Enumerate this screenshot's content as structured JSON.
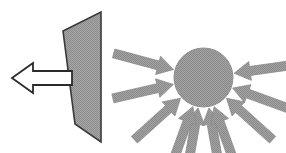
{
  "figure": {
    "title": "Flat plate with single directional arrow versus sphere with converging arrows",
    "background_color": "#ffffff",
    "width": 286,
    "height": 153,
    "palette": {
      "fill_gray": "#9e9e9e",
      "fill_gray_light": "#a8a8a8",
      "outline_dark": "#3a3a3a",
      "outline_black": "#2b2b2b",
      "white": "#ffffff",
      "dither_dark": "#8a8a8a"
    }
  },
  "left_panel": {
    "name": "flat-plate-with-thrust-arrow",
    "label": "Flat plate",
    "plate": {
      "shape": "trapezoid",
      "fill": "#9e9e9e",
      "stroke": "#3a3a3a",
      "stroke_width": 1.6,
      "points": "63,31 101,12 101,142 75,124"
    },
    "arrow": {
      "name": "thrust-arrow-left",
      "direction": "left",
      "fill": "#ffffff",
      "stroke": "#2b2b2b",
      "stroke_width": 1.8,
      "points": "12,78 33,63 33,71 72,71 72,85 33,85 33,93"
    }
  },
  "right_panel": {
    "name": "sphere-with-converging-arrows",
    "label": "Sphere under uniform pressure",
    "circle": {
      "name": "sphere-body",
      "cx": 203.5,
      "cy": 77.5,
      "r": 29.5,
      "fill": "#9e9e9e",
      "stroke": "#8f8f8f",
      "stroke_width": 1
    },
    "arrow_fill": "#9e9e9e",
    "arrow_stroke": "#8c8c8c",
    "arrow_count": 10,
    "arrows": [
      {
        "name": "arrow-top-left",
        "angle_deg": 260,
        "tail_len": 46,
        "shaft_w": 9,
        "head_w": 19,
        "head_len": 16
      },
      {
        "name": "arrow-top-right",
        "angle_deg": 280,
        "tail_len": 46,
        "shaft_w": 9,
        "head_w": 19,
        "head_len": 16
      },
      {
        "name": "arrow-left-upper",
        "angle_deg": 165,
        "tail_len": 46,
        "shaft_w": 9,
        "head_w": 19,
        "head_len": 16
      },
      {
        "name": "arrow-left-lower",
        "angle_deg": 193,
        "tail_len": 46,
        "shaft_w": 9,
        "head_w": 19,
        "head_len": 16
      },
      {
        "name": "arrow-right-upper",
        "angle_deg": 8,
        "tail_len": 46,
        "shaft_w": 9,
        "head_w": 19,
        "head_len": 16
      },
      {
        "name": "arrow-right-lower",
        "angle_deg": 340,
        "tail_len": 46,
        "shaft_w": 9,
        "head_w": 19,
        "head_len": 16
      },
      {
        "name": "arrow-bottom-left-out",
        "angle_deg": 222,
        "tail_len": 46,
        "shaft_w": 9,
        "head_w": 19,
        "head_len": 16
      },
      {
        "name": "arrow-bottom-left-in",
        "angle_deg": 250,
        "tail_len": 46,
        "shaft_w": 9,
        "head_w": 19,
        "head_len": 16
      },
      {
        "name": "arrow-bottom-right-in",
        "angle_deg": 290,
        "tail_len": 46,
        "shaft_w": 9,
        "head_w": 19,
        "head_len": 16
      },
      {
        "name": "arrow-bottom-right-out",
        "angle_deg": 318,
        "tail_len": 46,
        "shaft_w": 9,
        "head_w": 19,
        "head_len": 16
      }
    ]
  }
}
